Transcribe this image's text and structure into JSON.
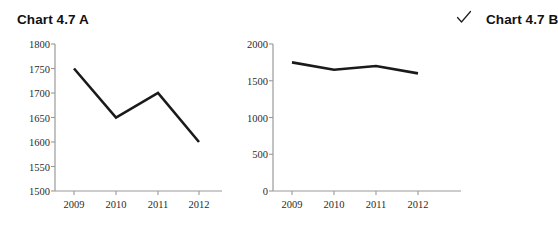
{
  "charts": [
    {
      "id": "chart-a",
      "title": "Chart 4.7 A",
      "checked": false,
      "check_glyph": ""
    },
    {
      "id": "chart-b",
      "title": "Chart 4.7 B",
      "checked": true,
      "check_glyph": "✓"
    }
  ],
  "chart_data": [
    {
      "type": "line",
      "title": "Chart 4.7 A",
      "categories": [
        "2009",
        "2010",
        "2011",
        "2012"
      ],
      "values": [
        1750,
        1650,
        1700,
        1600
      ],
      "xlabel": "",
      "ylabel": "",
      "ylim": [
        1500,
        1800
      ],
      "yticks": [
        1500,
        1550,
        1600,
        1650,
        1700,
        1750,
        1800
      ],
      "ytick_labels": [
        "1500",
        "1550",
        "1600",
        "1650",
        "1700",
        "1750",
        "1800"
      ],
      "grid": false,
      "legend": "none",
      "line_color": "#1a1a1a",
      "axis_color": "#9a9a9a"
    },
    {
      "type": "line",
      "title": "Chart 4.7 B",
      "categories": [
        "2009",
        "2010",
        "2011",
        "2012"
      ],
      "values": [
        1750,
        1650,
        1700,
        1600
      ],
      "xlabel": "",
      "ylabel": "",
      "ylim": [
        0,
        2000
      ],
      "yticks": [
        0,
        500,
        1000,
        1500,
        2000
      ],
      "ytick_labels": [
        "0",
        "500",
        "1000",
        "1500",
        "2000"
      ],
      "grid": false,
      "legend": "none",
      "line_color": "#1a1a1a",
      "axis_color": "#9a9a9a"
    }
  ]
}
